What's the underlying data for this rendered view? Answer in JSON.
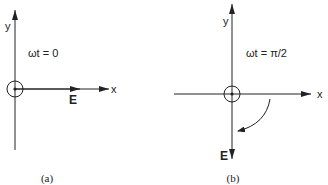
{
  "panels": [
    {
      "id": "a",
      "x_axis_label": "x",
      "y_axis_label": "y",
      "phase_label": "ωt = 0",
      "vector_label": "E",
      "vector_direction": "+x",
      "caption": "(a)"
    },
    {
      "id": "b",
      "x_axis_label": "x",
      "y_axis_label": "y",
      "phase_label": "ωt = π/2",
      "vector_label": "E",
      "vector_direction": "-y",
      "rotation": "clockwise",
      "caption": "(b)"
    }
  ],
  "colors": {
    "stroke": "#222222",
    "background": "#ffffff"
  }
}
